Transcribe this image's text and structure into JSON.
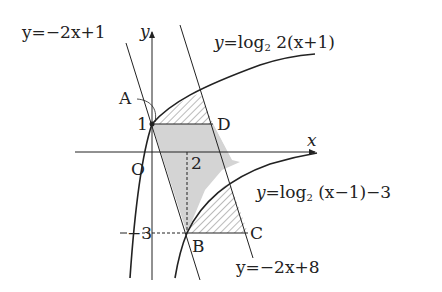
{
  "diagram": {
    "axes": {
      "x_label": "x",
      "y_label": "y",
      "origin_label": "O"
    },
    "ticks": {
      "y_one": "1",
      "x_two": "2",
      "y_neg_three": "−3"
    },
    "points": {
      "A": {
        "label": "A",
        "coords": [
          0,
          1
        ]
      },
      "B": {
        "label": "B",
        "coords": [
          2,
          -3
        ]
      },
      "C": {
        "label": "C",
        "coords": [
          5.5,
          -3
        ]
      },
      "D": {
        "label": "D",
        "coords": [
          3.5,
          1
        ]
      }
    },
    "curves": [
      {
        "id": "log-upper",
        "label_y": "y",
        "label_eq": "=log",
        "label_base": "2",
        "label_arg": " 2(x+1)"
      },
      {
        "id": "log-lower",
        "label_y": "y",
        "label_eq": "=log",
        "label_base": "2",
        "label_arg": " (x−1)−3"
      }
    ],
    "lines": [
      {
        "id": "line-upper",
        "label": "y=−2x+1"
      },
      {
        "id": "line-lower",
        "label": "y=−2x+8"
      }
    ],
    "regions": {
      "gray_fill": "#d4d4d4",
      "hatch_color": "#555555"
    }
  }
}
